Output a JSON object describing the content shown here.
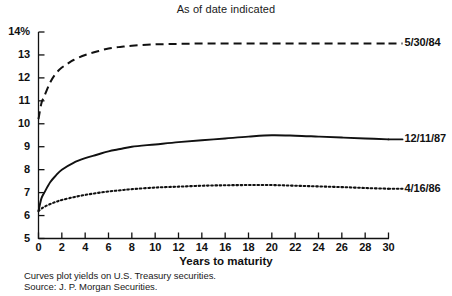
{
  "chart_data": {
    "type": "line",
    "title": "As of date indicated",
    "xlabel": "Years to maturity",
    "ylabel": "",
    "xlim": [
      0,
      30
    ],
    "ylim": [
      5,
      14
    ],
    "grid": false,
    "legend_position": "right-of-plot-end-labels",
    "xticks": [
      0,
      2,
      4,
      6,
      8,
      10,
      12,
      14,
      16,
      18,
      20,
      22,
      24,
      26,
      28,
      30
    ],
    "xtick_labels": [
      "0",
      "2",
      "4",
      "6",
      "8",
      "10",
      "12",
      "14",
      "16",
      "18",
      "20",
      "22",
      "24",
      "26",
      "28",
      "30"
    ],
    "yticks": [
      5,
      6,
      7,
      8,
      9,
      10,
      11,
      12,
      13,
      14
    ],
    "ytick_labels": [
      "5",
      "6",
      "7",
      "8",
      "9",
      "10",
      "11",
      "12",
      "13",
      "14%"
    ],
    "series": [
      {
        "name": "5/30/84",
        "style": "dashed",
        "color": "#111111",
        "x": [
          0,
          0.25,
          0.5,
          1,
          1.5,
          2,
          2.5,
          3,
          4,
          5,
          6,
          7,
          8,
          10,
          12,
          14,
          16,
          18,
          20,
          22,
          24,
          26,
          28,
          30
        ],
        "values": [
          10.2,
          10.9,
          11.2,
          11.8,
          12.2,
          12.45,
          12.62,
          12.78,
          13.0,
          13.15,
          13.28,
          13.35,
          13.4,
          13.46,
          13.48,
          13.5,
          13.5,
          13.5,
          13.5,
          13.5,
          13.5,
          13.5,
          13.5,
          13.5
        ]
      },
      {
        "name": "12/11/87",
        "style": "solid",
        "color": "#111111",
        "x": [
          0,
          0.25,
          0.5,
          1,
          1.5,
          2,
          3,
          4,
          5,
          6,
          7,
          8,
          10,
          12,
          14,
          16,
          18,
          20,
          22,
          24,
          26,
          28,
          30
        ],
        "values": [
          6.2,
          6.75,
          7.0,
          7.45,
          7.75,
          8.0,
          8.3,
          8.5,
          8.65,
          8.8,
          8.9,
          9.0,
          9.1,
          9.2,
          9.28,
          9.36,
          9.44,
          9.5,
          9.48,
          9.44,
          9.4,
          9.36,
          9.32
        ]
      },
      {
        "name": "4/16/86",
        "style": "dotted",
        "color": "#111111",
        "x": [
          0,
          0.25,
          0.5,
          1,
          1.5,
          2,
          3,
          4,
          5,
          6,
          7,
          8,
          10,
          12,
          14,
          16,
          18,
          20,
          22,
          24,
          26,
          28,
          30
        ],
        "values": [
          6.2,
          6.3,
          6.38,
          6.5,
          6.6,
          6.68,
          6.8,
          6.9,
          6.98,
          7.05,
          7.1,
          7.15,
          7.22,
          7.26,
          7.3,
          7.32,
          7.33,
          7.33,
          7.3,
          7.27,
          7.24,
          7.2,
          7.17
        ]
      }
    ],
    "annotations": [
      "Curves plot yields on U.S. Treasury securities.",
      "Source: J. P. Morgan Securities."
    ]
  },
  "footnotes": {
    "line1": "Curves plot yields on U.S. Treasury securities.",
    "line2": "Source: J. P. Morgan Securities."
  },
  "axis": {
    "x_title": "Years to maturity"
  }
}
